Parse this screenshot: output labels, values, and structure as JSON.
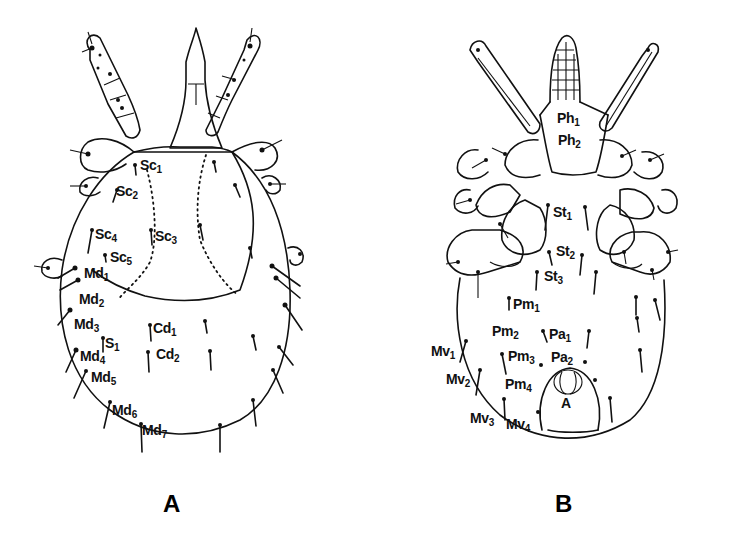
{
  "figure": {
    "panels": [
      {
        "id": "A",
        "label": "A",
        "view": "dorsal",
        "setae": [
          {
            "base": "Sc",
            "sub": "1",
            "x": 140,
            "y": 158
          },
          {
            "base": "Sc",
            "sub": "2",
            "x": 116,
            "y": 184
          },
          {
            "base": "Sc",
            "sub": "4",
            "x": 95,
            "y": 227
          },
          {
            "base": "Sc",
            "sub": "3",
            "x": 155,
            "y": 229
          },
          {
            "base": "Sc",
            "sub": "5",
            "x": 110,
            "y": 250
          },
          {
            "base": "Md",
            "sub": "1",
            "x": 84,
            "y": 266
          },
          {
            "base": "Md",
            "sub": "2",
            "x": 79,
            "y": 292
          },
          {
            "base": "Md",
            "sub": "3",
            "x": 74,
            "y": 317
          },
          {
            "base": "Cd",
            "sub": "1",
            "x": 153,
            "y": 321
          },
          {
            "base": "S",
            "sub": "1",
            "x": 105,
            "y": 336
          },
          {
            "base": "Cd",
            "sub": "2",
            "x": 156,
            "y": 347
          },
          {
            "base": "Md",
            "sub": "4",
            "x": 80,
            "y": 349
          },
          {
            "base": "Md",
            "sub": "5",
            "x": 91,
            "y": 370
          },
          {
            "base": "Md",
            "sub": "6",
            "x": 112,
            "y": 403
          },
          {
            "base": "Md",
            "sub": "7",
            "x": 142,
            "y": 423
          }
        ]
      },
      {
        "id": "B",
        "label": "B",
        "view": "ventral",
        "setae": [
          {
            "base": "Ph",
            "sub": "1",
            "x": 557,
            "y": 111
          },
          {
            "base": "Ph",
            "sub": "2",
            "x": 558,
            "y": 133
          },
          {
            "base": "St",
            "sub": "1",
            "x": 553,
            "y": 205
          },
          {
            "base": "St",
            "sub": "2",
            "x": 556,
            "y": 244
          },
          {
            "base": "St",
            "sub": "3",
            "x": 544,
            "y": 269
          },
          {
            "base": "Pm",
            "sub": "1",
            "x": 513,
            "y": 297
          },
          {
            "base": "Pm",
            "sub": "2",
            "x": 492,
            "y": 324
          },
          {
            "base": "Pa",
            "sub": "1",
            "x": 549,
            "y": 327
          },
          {
            "base": "Mv",
            "sub": "1",
            "x": 431,
            "y": 344
          },
          {
            "base": "Pm",
            "sub": "3",
            "x": 508,
            "y": 349
          },
          {
            "base": "Pa",
            "sub": "2",
            "x": 551,
            "y": 350
          },
          {
            "base": "Mv",
            "sub": "2",
            "x": 446,
            "y": 372
          },
          {
            "base": "Pm",
            "sub": "4",
            "x": 505,
            "y": 377
          },
          {
            "base": "A",
            "sub": "",
            "x": 561,
            "y": 396
          },
          {
            "base": "Mv",
            "sub": "3",
            "x": 470,
            "y": 411
          },
          {
            "base": "Mv",
            "sub": "4",
            "x": 506,
            "y": 417
          }
        ]
      }
    ]
  }
}
